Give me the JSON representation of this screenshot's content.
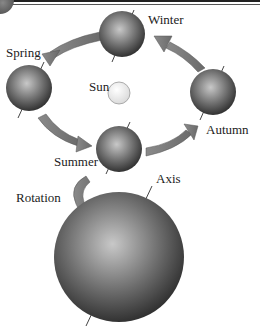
{
  "diagram": {
    "labels": {
      "winter": "Winter",
      "spring": "Spring",
      "sun": "Sun",
      "autumn": "Autumn",
      "summer": "Summer",
      "rotation": "Rotation",
      "axis": "Axis"
    }
  }
}
